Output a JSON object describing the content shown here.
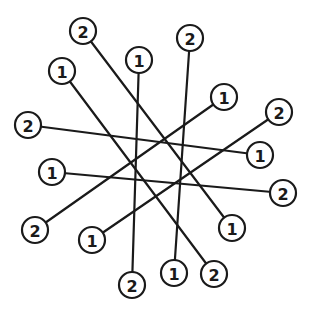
{
  "diagram": {
    "type": "graph",
    "colors": {
      "stroke": "#1a1a1a",
      "background": "#ffffff"
    },
    "node_radius": 13,
    "nodes": [
      {
        "id": "n0",
        "label": "2",
        "x": 83,
        "y": 31
      },
      {
        "id": "n1",
        "label": "1",
        "x": 139,
        "y": 60
      },
      {
        "id": "n2",
        "label": "2",
        "x": 190,
        "y": 38
      },
      {
        "id": "n3",
        "label": "1",
        "x": 62,
        "y": 71
      },
      {
        "id": "n4",
        "label": "2",
        "x": 28,
        "y": 125
      },
      {
        "id": "n5",
        "label": "1",
        "x": 224,
        "y": 97
      },
      {
        "id": "n6",
        "label": "2",
        "x": 279,
        "y": 112
      },
      {
        "id": "n7",
        "label": "1",
        "x": 260,
        "y": 155
      },
      {
        "id": "n8",
        "label": "1",
        "x": 52,
        "y": 172
      },
      {
        "id": "n9",
        "label": "2",
        "x": 283,
        "y": 193
      },
      {
        "id": "n10",
        "label": "2",
        "x": 35,
        "y": 230
      },
      {
        "id": "n11",
        "label": "1",
        "x": 232,
        "y": 228
      },
      {
        "id": "n12",
        "label": "1",
        "x": 92,
        "y": 240
      },
      {
        "id": "n13",
        "label": "2",
        "x": 132,
        "y": 285
      },
      {
        "id": "n14",
        "label": "1",
        "x": 174,
        "y": 273
      },
      {
        "id": "n15",
        "label": "2",
        "x": 214,
        "y": 274
      }
    ],
    "edges": [
      {
        "from": "n0",
        "to": "n11"
      },
      {
        "from": "n1",
        "to": "n13"
      },
      {
        "from": "n2",
        "to": "n14"
      },
      {
        "from": "n3",
        "to": "n15"
      },
      {
        "from": "n4",
        "to": "n7"
      },
      {
        "from": "n5",
        "to": "n10"
      },
      {
        "from": "n6",
        "to": "n12"
      },
      {
        "from": "n8",
        "to": "n9"
      }
    ]
  }
}
